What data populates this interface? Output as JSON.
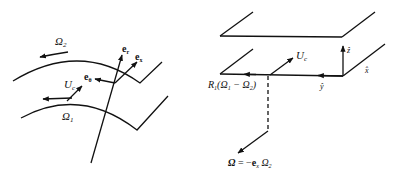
{
  "left_figure": {
    "labels": {
      "omega2": "Ω",
      "omega2_sub": "2",
      "omega1": "Ω",
      "omega1_sub": "1",
      "e_r": "e",
      "e_r_sub": "r",
      "e_x": "e",
      "e_x_sub": "x",
      "e_theta": "e",
      "e_theta_sub": "θ",
      "u_c": "U",
      "u_c_sub": "c"
    }
  },
  "right_figure": {
    "labels": {
      "u_c": "U",
      "u_c_sub": "c",
      "z_hat": "ẑ",
      "x_hat": "x̂",
      "y_hat": "ŷ",
      "r1_text": "R",
      "r1_sub": "1",
      "r1_rest": "(Ω",
      "r1_o1_sub": "1",
      "r1_minus": " − Ω",
      "r1_o2_sub": "2",
      "r1_close": ")",
      "omega_eq_lhs": "Ω",
      "omega_eq_mid": " = −",
      "omega_eq_e": "e",
      "omega_eq_e_sub": "x",
      "omega_eq_o": " Ω",
      "omega_eq_o_sub": "2"
    }
  },
  "colors": {
    "stroke": "#111111",
    "background": "#ffffff"
  }
}
